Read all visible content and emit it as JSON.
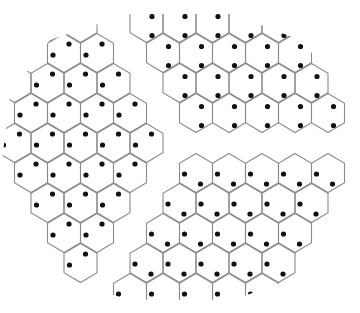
{
  "diagram": {
    "title": "",
    "colors": {
      "background": "#ffffff",
      "edge": "#8a8a8a",
      "dot": "#111111"
    },
    "lattice": {
      "origin_x": 97,
      "origin_y": 53,
      "col_spacing": 33,
      "row_spacing": 30,
      "odd_row_shift": -16.5,
      "hex_radius": 19.5
    },
    "dot_radius": 2.6,
    "regions": {
      "A": {
        "label": "domain-left",
        "dot_offsets": [
          [
            5,
            -9
          ],
          [
            -11,
            2
          ]
        ]
      },
      "B": {
        "label": "domain-upper-right",
        "dot_offsets": [
          [
            5.5,
            -6.5
          ],
          [
            5.5,
            12.5
          ]
        ]
      },
      "C": {
        "label": "domain-lower-right",
        "dot_offsets": [
          [
            -11.5,
            1
          ],
          [
            4.5,
            11
          ]
        ]
      }
    },
    "rows": [
      {
        "j": -1,
        "cells": [
          {
            "x": 47.5,
            "r": "A"
          },
          {
            "x": 80.5,
            "r": "A"
          },
          {
            "x": 146.5,
            "r": "B"
          },
          {
            "x": 179.5,
            "r": "B"
          },
          {
            "x": 212.5,
            "r": "B"
          },
          {
            "x": 245.5,
            "r": "B"
          },
          {
            "x": 278.5,
            "r": "B"
          }
        ]
      },
      {
        "j": 0,
        "cells": [
          {
            "x": 64,
            "r": "A"
          },
          {
            "x": 97,
            "r": "A"
          },
          {
            "x": 163,
            "r": "B"
          },
          {
            "x": 196,
            "r": "B"
          },
          {
            "x": 229,
            "r": "B"
          },
          {
            "x": 262,
            "r": "B"
          },
          {
            "x": 295,
            "r": "B"
          }
        ]
      },
      {
        "j": 1,
        "cells": [
          {
            "x": 14.5,
            "r": "A"
          },
          {
            "x": 47.5,
            "r": "A"
          },
          {
            "x": 80.5,
            "r": "A"
          },
          {
            "x": 113.5,
            "r": "A"
          },
          {
            "x": 179.5,
            "r": "B"
          },
          {
            "x": 212.5,
            "r": "B"
          },
          {
            "x": 245.5,
            "r": "B"
          },
          {
            "x": 278.5,
            "r": "B"
          },
          {
            "x": 311.5,
            "r": "B"
          }
        ]
      },
      {
        "j": 2,
        "cells": [
          {
            "x": 31,
            "r": "A"
          },
          {
            "x": 64,
            "r": "A"
          },
          {
            "x": 97,
            "r": "A"
          },
          {
            "x": 130,
            "r": "A"
          },
          {
            "x": 196,
            "r": "B"
          },
          {
            "x": 229,
            "r": "B"
          },
          {
            "x": 262,
            "r": "B"
          },
          {
            "x": 295,
            "r": "B"
          },
          {
            "x": 328,
            "r": "B"
          }
        ]
      },
      {
        "j": 3,
        "cells": [
          {
            "x": 14.5,
            "r": "A"
          },
          {
            "x": 47.5,
            "r": "A"
          },
          {
            "x": 80.5,
            "r": "A"
          },
          {
            "x": 113.5,
            "r": "A"
          },
          {
            "x": 146.5,
            "r": "A"
          }
        ]
      },
      {
        "j": 4,
        "cells": [
          {
            "x": 31,
            "r": "A"
          },
          {
            "x": 64,
            "r": "A"
          },
          {
            "x": 97,
            "r": "A"
          },
          {
            "x": 130,
            "r": "A"
          },
          {
            "x": 196,
            "r": "C"
          },
          {
            "x": 229,
            "r": "C"
          },
          {
            "x": 262,
            "r": "C"
          },
          {
            "x": 295,
            "r": "C"
          },
          {
            "x": 328,
            "r": "C"
          }
        ]
      },
      {
        "j": 5,
        "cells": [
          {
            "x": 47.5,
            "r": "A"
          },
          {
            "x": 80.5,
            "r": "A"
          },
          {
            "x": 113.5,
            "r": "A"
          },
          {
            "x": 179.5,
            "r": "C"
          },
          {
            "x": 212.5,
            "r": "C"
          },
          {
            "x": 245.5,
            "r": "C"
          },
          {
            "x": 278.5,
            "r": "C"
          },
          {
            "x": 311.5,
            "r": "C"
          }
        ]
      },
      {
        "j": 6,
        "cells": [
          {
            "x": 64,
            "r": "A"
          },
          {
            "x": 97,
            "r": "A"
          },
          {
            "x": 163,
            "r": "C"
          },
          {
            "x": 196,
            "r": "C"
          },
          {
            "x": 229,
            "r": "C"
          },
          {
            "x": 262,
            "r": "C"
          },
          {
            "x": 295,
            "r": "C"
          }
        ]
      },
      {
        "j": 7,
        "cells": [
          {
            "x": 80.5,
            "r": "A"
          },
          {
            "x": 146.5,
            "r": "C"
          },
          {
            "x": 179.5,
            "r": "C"
          },
          {
            "x": 212.5,
            "r": "C"
          },
          {
            "x": 245.5,
            "r": "C"
          },
          {
            "x": 278.5,
            "r": "C"
          }
        ]
      },
      {
        "j": 8,
        "cells": [
          {
            "x": 130,
            "r": "C"
          },
          {
            "x": 163,
            "r": "C"
          },
          {
            "x": 196,
            "r": "C"
          },
          {
            "x": 229,
            "r": "C"
          },
          {
            "x": 262,
            "r": "C"
          }
        ]
      }
    ],
    "envelope": [
      [
        128,
        14
      ],
      [
        232,
        14
      ],
      [
        300,
        40
      ],
      [
        350,
        95
      ],
      [
        358,
        160
      ],
      [
        340,
        225
      ],
      [
        290,
        280
      ],
      [
        232,
        300
      ],
      [
        128,
        300
      ],
      [
        70,
        280
      ],
      [
        20,
        225
      ],
      [
        2,
        160
      ],
      [
        10,
        95
      ],
      [
        50,
        40
      ]
    ]
  }
}
